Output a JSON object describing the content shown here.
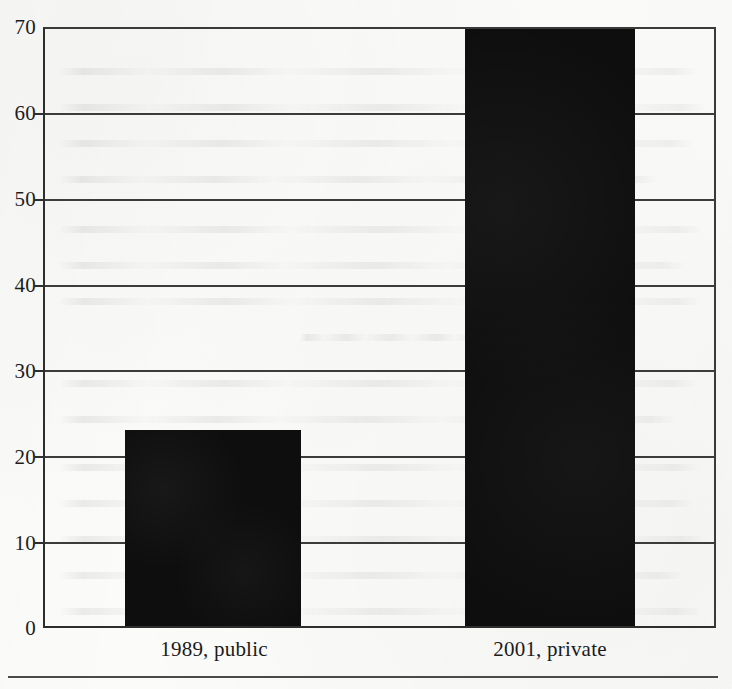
{
  "chart_data": {
    "type": "bar",
    "title": "",
    "subtitle": "",
    "xlabel": "",
    "ylabel": "",
    "categories": [
      "1989, public",
      "2001, private"
    ],
    "values": [
      23,
      70
    ],
    "series": [
      {
        "name": "",
        "values": [
          23,
          70
        ]
      }
    ],
    "ylim": [
      0,
      70
    ],
    "yticks": [
      0,
      10,
      20,
      30,
      40,
      50,
      60,
      70
    ],
    "ytick_labels": [
      "0",
      "10",
      "20",
      "30",
      "40",
      "50",
      "60",
      "70"
    ],
    "xtick_labels": [
      "1989, public",
      "2001, private"
    ],
    "grid": true,
    "grid_axis": "y",
    "legend": false,
    "legend_position": "none",
    "annotations": [],
    "bar_color": "#0e0e0e",
    "axis_color": "#2e2e2e",
    "grid_color": "#3c3c3c",
    "background_color": "#fbfbfa"
  },
  "axis": {
    "y_labels": [
      {
        "value": 70,
        "text": "70"
      },
      {
        "value": 60,
        "text": "60"
      },
      {
        "value": 50,
        "text": "50"
      },
      {
        "value": 40,
        "text": "40"
      },
      {
        "value": 30,
        "text": "30"
      },
      {
        "value": 20,
        "text": "20"
      },
      {
        "value": 10,
        "text": "10"
      },
      {
        "value": 0,
        "text": "0"
      }
    ]
  },
  "bars": [
    {
      "label": "1989, public",
      "value": 23
    },
    {
      "label": "2001, private",
      "value": 70
    }
  ]
}
